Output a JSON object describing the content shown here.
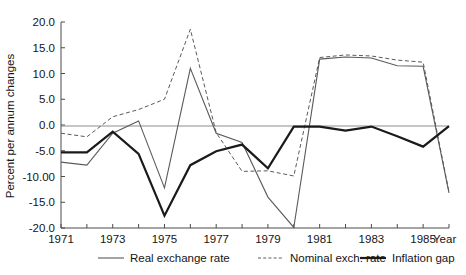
{
  "chart_data": {
    "type": "line",
    "title": "",
    "xlabel": "Year",
    "ylabel": "Percent per annum changes",
    "xlim": [
      1971,
      1986
    ],
    "ylim": [
      -20.0,
      20.0
    ],
    "grid": false,
    "legend_position": "bottom",
    "x_tick_labels": [
      "1971",
      "1973",
      "1975",
      "1977",
      "1979",
      "1981",
      "1983",
      "1985"
    ],
    "x_tick_values": [
      1971,
      1973,
      1975,
      1977,
      1979,
      1981,
      1983,
      1985
    ],
    "x_minor_ticks": [
      1972,
      1974,
      1976,
      1978,
      1980,
      1982,
      1984,
      1986
    ],
    "y_tick_labels": [
      "20.0",
      "15.0",
      "10.0",
      "5.0",
      "0.0",
      "-5.0",
      "-10.00",
      "-15.0",
      "-20.0"
    ],
    "y_tick_values": [
      20.0,
      15.0,
      10.0,
      5.0,
      0.0,
      -5.0,
      -10.0,
      -15.0,
      -20.0
    ],
    "x": [
      1971,
      1972,
      1973,
      1974,
      1975,
      1976,
      1977,
      1978,
      1979,
      1980,
      1981,
      1982,
      1983,
      1984,
      1985,
      1986
    ],
    "series": [
      {
        "name": "Real exchange rate",
        "style": "solid-thin",
        "color": "#5a5a5a",
        "width": 1.1,
        "values": [
          -7.2,
          -7.8,
          -1.6,
          0.8,
          -12.2,
          11.0,
          -1.6,
          -3.4,
          -14.0,
          -19.9,
          12.8,
          13.2,
          13.0,
          11.5,
          11.4,
          -13.2
        ]
      },
      {
        "name": "Nominal exch. rate",
        "style": "dashed",
        "color": "#5a5a5a",
        "width": 1.0,
        "values": [
          -1.6,
          -2.3,
          1.6,
          3.0,
          5.0,
          18.6,
          -1.5,
          -9.0,
          -8.9,
          -9.9,
          13.1,
          13.6,
          13.4,
          12.6,
          12.2,
          -13.0
        ]
      },
      {
        "name": "Inflation gap",
        "style": "solid-thick",
        "color": "#1a1a1a",
        "width": 2.2,
        "values": [
          -5.3,
          -5.3,
          -1.3,
          -5.6,
          -17.6,
          -7.8,
          -5.1,
          -3.8,
          -8.4,
          -0.3,
          -0.3,
          -1.1,
          -0.3,
          -2.2,
          -4.2,
          -0.2
        ]
      }
    ]
  },
  "legend": {
    "items": [
      {
        "label": "Real exchange rate",
        "style": "solid-thin"
      },
      {
        "label": "Nominal exch. rate",
        "style": "dashed"
      },
      {
        "label": "Inflation gap",
        "style": "solid-thick"
      }
    ]
  }
}
